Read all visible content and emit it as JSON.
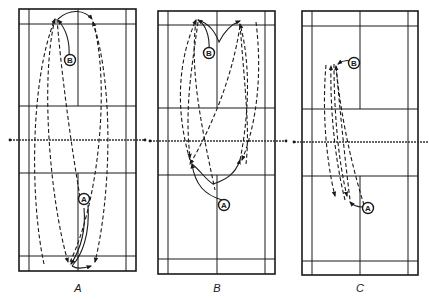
{
  "figure": {
    "type": "badminton court movement diagrams",
    "panels": [
      {
        "id": "A",
        "caption": "A",
        "players": [
          {
            "label": "B",
            "side": "far court",
            "description": "moves to back corner near rear service line"
          },
          {
            "label": "A",
            "side": "near court",
            "description": "moves back to rear center of court"
          }
        ],
        "description": "Long high clears exchanged between both rear courts; dashed shuttle trajectories run baseline to baseline"
      },
      {
        "id": "B",
        "caption": "B",
        "players": [
          {
            "label": "B",
            "side": "far court",
            "description": "moves to both rear corners"
          },
          {
            "label": "A",
            "side": "near court",
            "description": "moves forward to both front corners near net"
          }
        ],
        "description": "Player B clears from rear corners; player A returns from the forecourt near the net with crossing trajectories"
      },
      {
        "id": "C",
        "caption": "C",
        "players": [
          {
            "label": "B",
            "side": "far court",
            "description": "moves to mid-court left"
          },
          {
            "label": "A",
            "side": "near court",
            "description": "moves to mid-court left"
          }
        ],
        "description": "Flat drives exchanged along the side of the court between mid-courts"
      }
    ],
    "colors": {
      "lines": "#1a1a1a",
      "background": "#ffffff"
    }
  }
}
